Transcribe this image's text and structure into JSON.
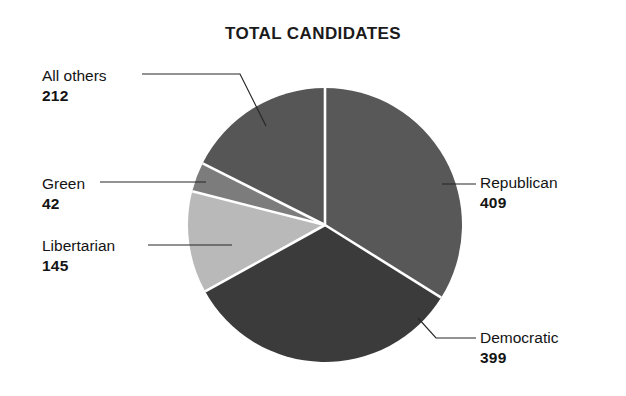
{
  "chart": {
    "title": "TOTAL CANDIDATES"
  },
  "labels": {
    "all_others": {
      "name": "All others",
      "value": "212"
    },
    "green": {
      "name": "Green",
      "value": "42"
    },
    "libertarian": {
      "name": "Libertarian",
      "value": "145"
    },
    "republican": {
      "name": "Republican",
      "value": "409"
    },
    "democratic": {
      "name": "Democratic",
      "value": "399"
    }
  },
  "chart_data": {
    "type": "pie",
    "title": "TOTAL CANDIDATES",
    "xlabel": "",
    "ylabel": "",
    "legend_position": "none",
    "grid": false,
    "total": 1207,
    "start_angle_deg": 0,
    "direction": "clockwise",
    "categories": [
      "Republican",
      "Democratic",
      "Libertarian",
      "Green",
      "All others"
    ],
    "values": [
      409,
      399,
      145,
      42,
      212
    ],
    "slices": [
      {
        "label": "Republican",
        "value": 409,
        "percent": 33.9,
        "angle_deg": 122.0,
        "color": "#585858",
        "label_side": "right",
        "leader": true
      },
      {
        "label": "Democratic",
        "value": 399,
        "percent": 33.1,
        "angle_deg": 119.0,
        "color": "#3b3b3b",
        "label_side": "right",
        "leader": true
      },
      {
        "label": "Libertarian",
        "value": 145,
        "percent": 12.0,
        "angle_deg": 43.2,
        "color": "#b9b9b9",
        "label_side": "left",
        "leader": true
      },
      {
        "label": "Green",
        "value": 42,
        "percent": 3.5,
        "angle_deg": 12.5,
        "color": "#7c7c7c",
        "label_side": "left",
        "leader": true
      },
      {
        "label": "All others",
        "value": 212,
        "percent": 17.6,
        "angle_deg": 63.2,
        "color": "#565656",
        "label_side": "left",
        "leader": true
      }
    ],
    "separator_color": "#ffffff",
    "background_color": "#ffffff",
    "text_color": "#141414"
  }
}
